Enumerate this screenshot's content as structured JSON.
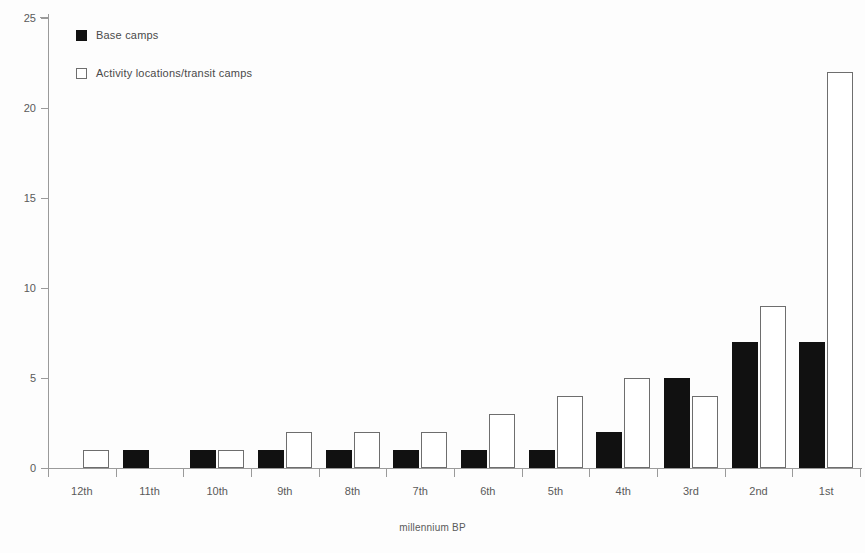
{
  "chart_data": {
    "type": "bar",
    "title": "",
    "xlabel": "millennium BP",
    "ylabel": "",
    "ylim": [
      0,
      25
    ],
    "yticks": [
      0,
      5,
      10,
      15,
      20,
      25
    ],
    "grid": false,
    "legend_position": "top-left",
    "categories": [
      "12th",
      "11th",
      "10th",
      "9th",
      "8th",
      "7th",
      "6th",
      "5th",
      "4th",
      "3rd",
      "2nd",
      "1st"
    ],
    "series": [
      {
        "name": "Base camps",
        "color": "#111111",
        "style": "filled",
        "values": [
          0,
          1,
          1,
          1,
          1,
          1,
          1,
          1,
          2,
          5,
          7,
          7
        ]
      },
      {
        "name": "Activity locations/transit camps",
        "color": "#ffffff",
        "style": "outlined",
        "values": [
          1,
          0,
          1,
          2,
          2,
          2,
          3,
          4,
          5,
          4,
          9,
          22
        ]
      }
    ]
  },
  "axes": {
    "y_tick_labels": [
      "0",
      "5",
      "10",
      "15",
      "20",
      "25"
    ],
    "x_tick_labels": [
      "12th",
      "11th",
      "10th",
      "9th",
      "8th",
      "7th",
      "6th",
      "5th",
      "4th",
      "3rd",
      "2nd",
      "1st"
    ],
    "x_axis_title": "millennium BP"
  },
  "legend": {
    "entries": [
      {
        "label": "Base camps",
        "swatch": "filled-black-square"
      },
      {
        "label": "Activity locations/transit camps",
        "swatch": "outlined-white-square"
      }
    ]
  }
}
